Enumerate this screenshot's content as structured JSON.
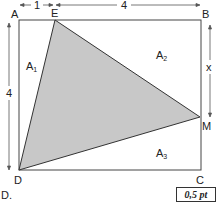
{
  "diagram": {
    "points": {
      "A": {
        "label": "A",
        "x": 19,
        "y": 20
      },
      "B": {
        "label": "B",
        "x": 201,
        "y": 20
      },
      "C": {
        "label": "C",
        "x": 201,
        "y": 170
      },
      "D": {
        "label": "D",
        "x": 19,
        "y": 170
      },
      "E": {
        "label": "E",
        "x": 55,
        "y": 20
      },
      "M": {
        "label": "M",
        "x": 200,
        "y": 117
      }
    },
    "dimensions": {
      "AE": "1",
      "EB": "4",
      "AD": "4",
      "BM": "x"
    },
    "regions": {
      "A1": {
        "label": "A",
        "sub": "1"
      },
      "A2": {
        "label": "A",
        "sub": "2"
      },
      "A3": {
        "label": "A",
        "sub": "3"
      }
    },
    "shaded_triangle": "DEM",
    "fill_color": "#c8c8c8",
    "stroke_color": "#333333"
  },
  "footer": {
    "item_label": "D.",
    "points_badge": "0,5 pt"
  }
}
